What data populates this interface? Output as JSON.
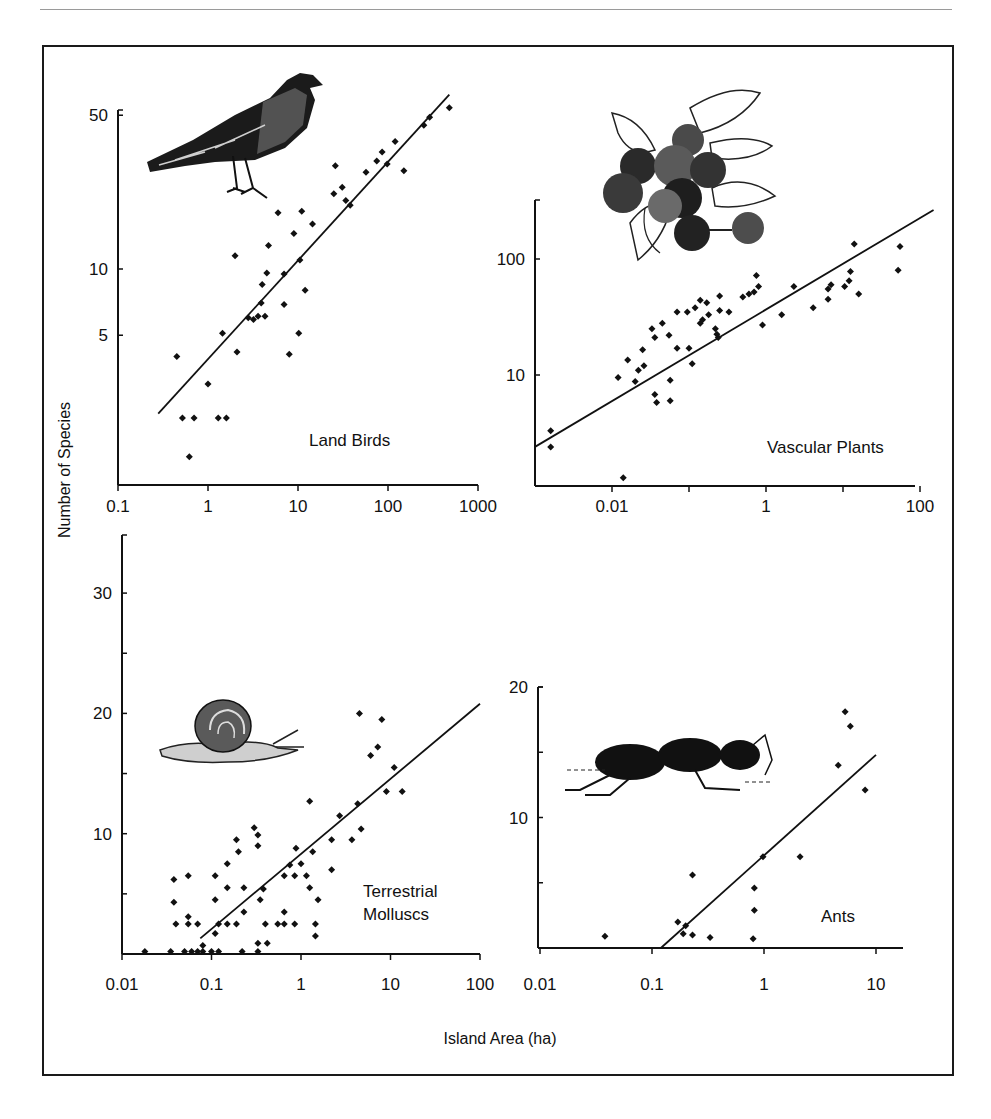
{
  "figure": {
    "y_axis_title": "Number of Species",
    "x_axis_title": "Island Area (ha)"
  },
  "chart_data": [
    {
      "type": "scatter",
      "panel": "Land Birds",
      "title": "Land Birds",
      "xlabel": "Island Area (ha)",
      "ylabel": "Number of Species",
      "xscale": "log",
      "yscale": "log",
      "xlim": [
        0.1,
        1000
      ],
      "ylim": [
        1.4,
        50
      ],
      "xticks": [
        "0.1",
        "1",
        "10",
        "100",
        "1000"
      ],
      "yticks": [
        "5",
        "10",
        "50"
      ],
      "illustration": "bird",
      "fit_line": {
        "x": [
          0.28,
          480
        ],
        "y": [
          2.2,
          62
        ]
      },
      "points": [
        {
          "x": 0.45,
          "y": 4.0
        },
        {
          "x": 0.52,
          "y": 2.1
        },
        {
          "x": 0.7,
          "y": 2.1
        },
        {
          "x": 0.62,
          "y": 1.4
        },
        {
          "x": 1.0,
          "y": 3.0
        },
        {
          "x": 1.3,
          "y": 2.1
        },
        {
          "x": 1.6,
          "y": 2.1
        },
        {
          "x": 1.45,
          "y": 5.1
        },
        {
          "x": 2.1,
          "y": 4.2
        },
        {
          "x": 2.0,
          "y": 11.5
        },
        {
          "x": 2.8,
          "y": 6.0
        },
        {
          "x": 3.2,
          "y": 5.9
        },
        {
          "x": 3.6,
          "y": 6.1
        },
        {
          "x": 4.3,
          "y": 6.1
        },
        {
          "x": 3.9,
          "y": 7.0
        },
        {
          "x": 4.0,
          "y": 8.5
        },
        {
          "x": 4.5,
          "y": 9.6
        },
        {
          "x": 4.7,
          "y": 12.8
        },
        {
          "x": 7.0,
          "y": 6.9
        },
        {
          "x": 8.0,
          "y": 4.1
        },
        {
          "x": 10.2,
          "y": 5.1
        },
        {
          "x": 7.0,
          "y": 9.5
        },
        {
          "x": 6.0,
          "y": 18.0
        },
        {
          "x": 9.0,
          "y": 14.5
        },
        {
          "x": 10.5,
          "y": 11.0
        },
        {
          "x": 11.0,
          "y": 18.3
        },
        {
          "x": 14.5,
          "y": 16.0
        },
        {
          "x": 12.0,
          "y": 8.0
        },
        {
          "x": 26.0,
          "y": 29.5
        },
        {
          "x": 25.0,
          "y": 22.0
        },
        {
          "x": 31.0,
          "y": 23.5
        },
        {
          "x": 34.0,
          "y": 20.5
        },
        {
          "x": 38.0,
          "y": 19.5
        },
        {
          "x": 57.0,
          "y": 27.5
        },
        {
          "x": 75.0,
          "y": 31.0
        },
        {
          "x": 86.0,
          "y": 34.0
        },
        {
          "x": 98.0,
          "y": 30.0
        },
        {
          "x": 120.0,
          "y": 38.0
        },
        {
          "x": 150.0,
          "y": 28.0
        },
        {
          "x": 250.0,
          "y": 45.0
        },
        {
          "x": 290.0,
          "y": 49.0
        },
        {
          "x": 480.0,
          "y": 54.0
        }
      ]
    },
    {
      "type": "scatter",
      "panel": "Vascular Plants",
      "title": "Vascular Plants",
      "xlabel": "Island Area (ha)",
      "ylabel": "Number of Species",
      "xscale": "log",
      "yscale": "log",
      "xlim": [
        0.001,
        100
      ],
      "ylim": [
        1,
        300
      ],
      "xticks": [
        "0.01",
        "1",
        "100"
      ],
      "yticks": [
        "10",
        "100"
      ],
      "illustration": "blueberries",
      "fit_line": {
        "x": [
          0.001,
          150
        ],
        "y": [
          2.4,
          265
        ]
      },
      "points": [
        {
          "x": 0.0016,
          "y": 3.3
        },
        {
          "x": 0.0016,
          "y": 2.4
        },
        {
          "x": 0.014,
          "y": 1.3
        },
        {
          "x": 0.012,
          "y": 9.5
        },
        {
          "x": 0.016,
          "y": 13.5
        },
        {
          "x": 0.02,
          "y": 8.8
        },
        {
          "x": 0.022,
          "y": 11.0
        },
        {
          "x": 0.025,
          "y": 16.5
        },
        {
          "x": 0.026,
          "y": 12.0
        },
        {
          "x": 0.033,
          "y": 25.0
        },
        {
          "x": 0.036,
          "y": 21.0
        },
        {
          "x": 0.036,
          "y": 6.8
        },
        {
          "x": 0.038,
          "y": 5.8
        },
        {
          "x": 0.045,
          "y": 28.0
        },
        {
          "x": 0.055,
          "y": 22.0
        },
        {
          "x": 0.057,
          "y": 9.0
        },
        {
          "x": 0.057,
          "y": 6.0
        },
        {
          "x": 0.07,
          "y": 35.0
        },
        {
          "x": 0.07,
          "y": 17.0
        },
        {
          "x": 0.095,
          "y": 35.0
        },
        {
          "x": 0.1,
          "y": 17.0
        },
        {
          "x": 0.11,
          "y": 12.5
        },
        {
          "x": 0.12,
          "y": 38.0
        },
        {
          "x": 0.14,
          "y": 44.0
        },
        {
          "x": 0.14,
          "y": 28.0
        },
        {
          "x": 0.15,
          "y": 30.0
        },
        {
          "x": 0.17,
          "y": 42.0
        },
        {
          "x": 0.18,
          "y": 33.0
        },
        {
          "x": 0.22,
          "y": 25.0
        },
        {
          "x": 0.23,
          "y": 22.5
        },
        {
          "x": 0.25,
          "y": 48.0
        },
        {
          "x": 0.25,
          "y": 36.0
        },
        {
          "x": 0.24,
          "y": 21.0
        },
        {
          "x": 0.33,
          "y": 35.0
        },
        {
          "x": 0.5,
          "y": 47.0
        },
        {
          "x": 0.6,
          "y": 50.0
        },
        {
          "x": 0.7,
          "y": 52.0
        },
        {
          "x": 0.75,
          "y": 72.0
        },
        {
          "x": 0.8,
          "y": 58.0
        },
        {
          "x": 0.9,
          "y": 27.0
        },
        {
          "x": 1.6,
          "y": 33.0
        },
        {
          "x": 2.3,
          "y": 58.0
        },
        {
          "x": 4.1,
          "y": 38.0
        },
        {
          "x": 6.4,
          "y": 45.0
        },
        {
          "x": 6.4,
          "y": 55.0
        },
        {
          "x": 7.0,
          "y": 60.0
        },
        {
          "x": 10.5,
          "y": 58.0
        },
        {
          "x": 12.0,
          "y": 65.0
        },
        {
          "x": 12.5,
          "y": 78.0
        },
        {
          "x": 14.0,
          "y": 135.0
        },
        {
          "x": 16.0,
          "y": 50.0
        },
        {
          "x": 52.0,
          "y": 80.0
        },
        {
          "x": 55.0,
          "y": 128.0
        }
      ]
    },
    {
      "type": "scatter",
      "panel": "Terrestrial Molluscs",
      "title": "Terrestrial Molluscs",
      "xlabel": "Island Area (ha)",
      "ylabel": "Number of Species",
      "xscale": "log",
      "yscale": "linear",
      "xlim": [
        0.01,
        100
      ],
      "ylim": [
        0,
        34
      ],
      "xticks": [
        "0.01",
        "0.1",
        "1",
        "10",
        "100"
      ],
      "yticks": [
        "10",
        "20",
        "30"
      ],
      "illustration": "snail",
      "fit_line": {
        "x": [
          0.075,
          100
        ],
        "y": [
          1.3,
          20.8
        ]
      },
      "points": [
        {
          "x": 0.018,
          "y": 0.2
        },
        {
          "x": 0.035,
          "y": 0.2
        },
        {
          "x": 0.05,
          "y": 0.2
        },
        {
          "x": 0.06,
          "y": 0.2
        },
        {
          "x": 0.07,
          "y": 0.2
        },
        {
          "x": 0.08,
          "y": 0.2
        },
        {
          "x": 0.1,
          "y": 0.2
        },
        {
          "x": 0.12,
          "y": 0.2
        },
        {
          "x": 0.22,
          "y": 0.2
        },
        {
          "x": 0.33,
          "y": 0.2
        },
        {
          "x": 0.08,
          "y": 0.7
        },
        {
          "x": 0.33,
          "y": 0.9
        },
        {
          "x": 0.42,
          "y": 0.9
        },
        {
          "x": 0.038,
          "y": 4.3
        },
        {
          "x": 0.04,
          "y": 2.5
        },
        {
          "x": 0.038,
          "y": 6.2
        },
        {
          "x": 0.055,
          "y": 6.5
        },
        {
          "x": 0.055,
          "y": 3.1
        },
        {
          "x": 0.055,
          "y": 2.5
        },
        {
          "x": 0.07,
          "y": 2.5
        },
        {
          "x": 0.11,
          "y": 6.5
        },
        {
          "x": 0.11,
          "y": 4.5
        },
        {
          "x": 0.11,
          "y": 1.7
        },
        {
          "x": 0.12,
          "y": 2.5
        },
        {
          "x": 0.15,
          "y": 7.5
        },
        {
          "x": 0.15,
          "y": 5.5
        },
        {
          "x": 0.15,
          "y": 2.5
        },
        {
          "x": 0.19,
          "y": 9.5
        },
        {
          "x": 0.2,
          "y": 8.5
        },
        {
          "x": 0.19,
          "y": 2.5
        },
        {
          "x": 0.23,
          "y": 5.5
        },
        {
          "x": 0.23,
          "y": 3.5
        },
        {
          "x": 0.3,
          "y": 10.5
        },
        {
          "x": 0.33,
          "y": 9.0
        },
        {
          "x": 0.33,
          "y": 9.9
        },
        {
          "x": 0.35,
          "y": 4.5
        },
        {
          "x": 0.38,
          "y": 5.4
        },
        {
          "x": 0.4,
          "y": 2.5
        },
        {
          "x": 0.55,
          "y": 2.5
        },
        {
          "x": 0.65,
          "y": 3.5
        },
        {
          "x": 0.65,
          "y": 2.5
        },
        {
          "x": 0.65,
          "y": 6.5
        },
        {
          "x": 0.75,
          "y": 7.4
        },
        {
          "x": 0.85,
          "y": 6.5
        },
        {
          "x": 0.85,
          "y": 2.5
        },
        {
          "x": 0.88,
          "y": 8.8
        },
        {
          "x": 1.0,
          "y": 7.5
        },
        {
          "x": 1.15,
          "y": 6.5
        },
        {
          "x": 1.25,
          "y": 5.5
        },
        {
          "x": 1.25,
          "y": 12.7
        },
        {
          "x": 1.35,
          "y": 8.5
        },
        {
          "x": 1.45,
          "y": 2.5
        },
        {
          "x": 1.45,
          "y": 1.5
        },
        {
          "x": 1.55,
          "y": 4.5
        },
        {
          "x": 2.2,
          "y": 9.5
        },
        {
          "x": 2.2,
          "y": 7.0
        },
        {
          "x": 2.7,
          "y": 11.5
        },
        {
          "x": 3.7,
          "y": 9.5
        },
        {
          "x": 4.3,
          "y": 12.5
        },
        {
          "x": 4.7,
          "y": 10.4
        },
        {
          "x": 4.5,
          "y": 20.0
        },
        {
          "x": 6.0,
          "y": 16.5
        },
        {
          "x": 7.2,
          "y": 17.2
        },
        {
          "x": 8.0,
          "y": 19.5
        },
        {
          "x": 9.0,
          "y": 13.5
        },
        {
          "x": 11.0,
          "y": 15.5
        },
        {
          "x": 13.5,
          "y": 13.5
        }
      ]
    },
    {
      "type": "scatter",
      "panel": "Ants",
      "title": "Ants",
      "xlabel": "Island Area (ha)",
      "ylabel": "Number of Species",
      "xscale": "log",
      "yscale": "linear",
      "xlim": [
        0.01,
        15
      ],
      "ylim": [
        0,
        20
      ],
      "xticks": [
        "0.01",
        "0.1",
        "1",
        "10"
      ],
      "yticks": [
        "10",
        "20"
      ],
      "illustration": "ant",
      "fit_line": {
        "x": [
          0.12,
          10
        ],
        "y": [
          0,
          14.8
        ]
      },
      "points": [
        {
          "x": 0.038,
          "y": 0.9
        },
        {
          "x": 0.17,
          "y": 2.0
        },
        {
          "x": 0.19,
          "y": 1.1
        },
        {
          "x": 0.2,
          "y": 1.7
        },
        {
          "x": 0.23,
          "y": 1.0
        },
        {
          "x": 0.23,
          "y": 5.6
        },
        {
          "x": 0.33,
          "y": 0.8
        },
        {
          "x": 0.8,
          "y": 0.7
        },
        {
          "x": 0.82,
          "y": 2.9
        },
        {
          "x": 0.82,
          "y": 4.6
        },
        {
          "x": 0.98,
          "y": 7.0
        },
        {
          "x": 2.1,
          "y": 7.0
        },
        {
          "x": 4.6,
          "y": 14.0
        },
        {
          "x": 5.3,
          "y": 18.1
        },
        {
          "x": 5.9,
          "y": 17.0
        },
        {
          "x": 8.0,
          "y": 12.1
        }
      ]
    }
  ]
}
